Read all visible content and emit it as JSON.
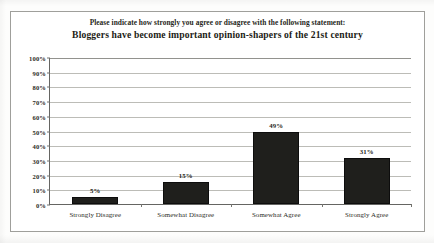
{
  "chart_data": {
    "type": "bar",
    "title": "Please indicate how strongly you agree or disagree with the following statement:\nBloggers have become important opinion-shapers of the 21st century",
    "title_line_1": "Please indicate how strongly you agree or disagree with the following statement:",
    "title_line_2": "Bloggers have become important opinion-shapers of the 21st century",
    "categories": [
      "Strongly Disagree",
      "Somewhat Disagree",
      "Somewhat Agree",
      "Strongly Agree"
    ],
    "values": [
      5,
      15,
      49,
      31
    ],
    "value_labels": [
      "5%",
      "15%",
      "49%",
      "31%"
    ],
    "xlabel": "",
    "ylabel": "",
    "ylim": [
      0,
      100
    ],
    "ytick_labels": [
      "100%",
      "90%",
      "80%",
      "70%",
      "60%",
      "50%",
      "40%",
      "30%",
      "20%",
      "10%",
      "0%"
    ],
    "ytick_values": [
      100,
      90,
      80,
      70,
      60,
      50,
      40,
      30,
      20,
      10,
      0
    ],
    "grid": true,
    "legend": false,
    "bar_color": "#131310",
    "gridline_color": "#b9b9b4",
    "axis_color": "#5d5d5a",
    "frame_color": "#9a9a96",
    "background": "#ffffff"
  }
}
